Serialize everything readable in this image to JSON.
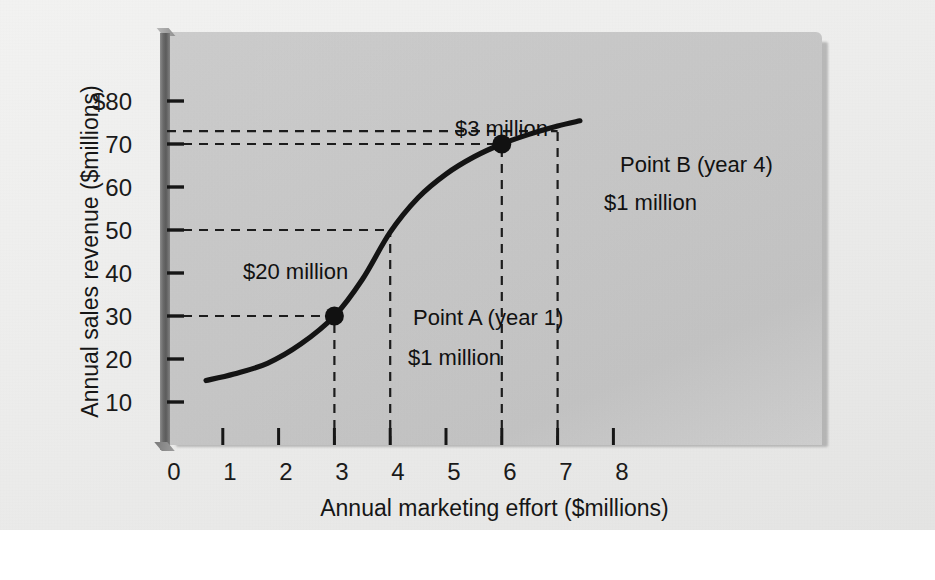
{
  "chart_data": {
    "type": "line",
    "title": "",
    "xlabel": "Annual marketing effort ($millions)",
    "ylabel": "Annual sales revenue ($millions)",
    "xlim": [
      0,
      8.6
    ],
    "ylim": [
      0,
      86
    ],
    "grid": false,
    "legend": "none",
    "x_ticks": [
      "0",
      "1",
      "2",
      "3",
      "4",
      "5",
      "6",
      "7",
      "8"
    ],
    "x_tick_values": [
      0,
      1,
      2,
      3,
      4,
      5,
      6,
      7,
      8
    ],
    "y_ticks": [
      "$80",
      "70",
      "60",
      "50",
      "40",
      "30",
      "20",
      "10"
    ],
    "y_tick_values": [
      80,
      70,
      60,
      50,
      40,
      30,
      20,
      10
    ],
    "series": [
      {
        "name": "Sales response curve",
        "x": [
          0.7,
          1.2,
          1.8,
          2.4,
          3.0,
          3.5,
          4.0,
          4.5,
          5.0,
          5.5,
          6.0,
          6.5,
          7.0,
          7.4
        ],
        "y": [
          15.0,
          16.5,
          19.0,
          23.5,
          30.0,
          38.5,
          49.5,
          57.5,
          63.0,
          67.0,
          70.0,
          72.3,
          74.2,
          75.4
        ]
      }
    ],
    "markers": [
      {
        "label": "Point A (year 1)",
        "x": 3,
        "y": 30
      },
      {
        "label": "Point B (year 4)",
        "x": 6,
        "y": 70
      }
    ],
    "guide_lines": [
      {
        "orientation": "horizontal",
        "value": 30,
        "from_x": 0,
        "to_x": 3
      },
      {
        "orientation": "horizontal",
        "value": 50,
        "from_x": 0,
        "to_x": 4
      },
      {
        "orientation": "horizontal",
        "value": 70,
        "from_x": 0,
        "to_x": 6
      },
      {
        "orientation": "horizontal",
        "value": 73,
        "from_x": 0,
        "to_x": 7
      },
      {
        "orientation": "vertical",
        "value": 3,
        "from_y": 0,
        "to_y": 30
      },
      {
        "orientation": "vertical",
        "value": 4,
        "from_y": 0,
        "to_y": 50
      },
      {
        "orientation": "vertical",
        "value": 6,
        "from_y": 0,
        "to_y": 70
      },
      {
        "orientation": "vertical",
        "value": 7,
        "from_y": 0,
        "to_y": 73
      }
    ],
    "annotations": [
      {
        "text": "$3 million",
        "x": 4.55,
        "y": 71.5
      },
      {
        "text": "$20 million",
        "x": 2.9,
        "y": 40.5
      },
      {
        "text": "Point B (year 4)",
        "x": 6.15,
        "y": 66.0
      },
      {
        "text": "$1 million",
        "x": 6.5,
        "y": 57.5
      },
      {
        "text": "Point A (year 1)",
        "x": 3.15,
        "y": 29.5
      },
      {
        "text": "$1 million",
        "x": 3.5,
        "y": 22.0
      }
    ],
    "colors": {
      "curve": "#141414",
      "marker": "#111111",
      "guide": "#1c1c1c",
      "plot_background": "#c8c8c8",
      "page_background": "#eeeeed",
      "text": "#161616"
    }
  },
  "axes": {
    "x_title": "Annual marketing effort ($millions)",
    "y_title": "Annual sales revenue ($millions)",
    "x_tick_labels": [
      "0",
      "1",
      "2",
      "3",
      "4",
      "5",
      "6",
      "7",
      "8"
    ],
    "y_tick_labels": [
      "$80",
      "70",
      "60",
      "50",
      "40",
      "30",
      "20",
      "10"
    ]
  },
  "annotations": {
    "three_million": "$3 million",
    "twenty_million": "$20 million",
    "point_b_label": "Point B (year 4)",
    "point_b_cost": "$1 million",
    "point_a_label": "Point A (year 1)",
    "point_a_cost": "$1 million"
  }
}
